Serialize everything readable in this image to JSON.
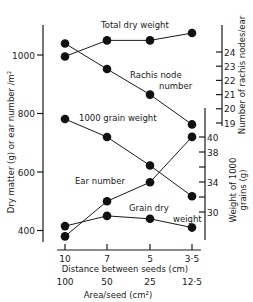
{
  "chart_data": {
    "type": "line",
    "title": "",
    "x": {
      "label": "Distance between seeds (cm)",
      "categories": [
        "10",
        "7",
        "5",
        "3·5"
      ],
      "secondary_label": "Area/seed (cm²)",
      "secondary_categories": [
        "100",
        "50",
        "25",
        "12·5"
      ]
    },
    "axes": {
      "left": {
        "label": "Dry matter (g) or ear number /m²",
        "ticks": [
          "400",
          "600",
          "800",
          "1000"
        ],
        "tick_values": [
          400,
          600,
          800,
          1000
        ],
        "range": [
          340,
          1130
        ]
      },
      "right_rachis": {
        "label": "Number of rachis nodes/ear",
        "ticks": [
          "19",
          "20",
          "21",
          "22",
          "23",
          "24"
        ],
        "tick_values": [
          19,
          20,
          21,
          22,
          23,
          24
        ],
        "range": [
          19,
          26
        ]
      },
      "right_grain": {
        "label_line1": "Weight of 1000",
        "label_line2": "grains (g)",
        "ticks": [
          "30",
          "34",
          "38",
          "40"
        ],
        "tick_values": [
          30,
          32,
          34,
          36,
          38,
          40
        ],
        "range": [
          26,
          40
        ]
      }
    },
    "series": [
      {
        "name": "Total dry weight",
        "axis": "left",
        "values": [
          995,
          1050,
          1050,
          1075
        ]
      },
      {
        "name": "Rachis node number",
        "axis": "right_rachis",
        "values": [
          24.6,
          22.8,
          21.0,
          18.9
        ]
      },
      {
        "name": "1000 grain weight",
        "axis": "right_grain",
        "values": [
          42.4,
          40.0,
          36.2,
          32.1
        ]
      },
      {
        "name": "Ear number",
        "axis": "left",
        "values": [
          380,
          500,
          565,
          720
        ]
      },
      {
        "name": "Grain dry weight",
        "axis": "left",
        "values": [
          415,
          450,
          440,
          410
        ]
      }
    ],
    "annotations": {
      "total_dry_weight": "Total dry weight",
      "rachis_line1": "Rachis node",
      "rachis_line2": "number",
      "grain_weight_1000": "1000 grain weight",
      "ear_number": "Ear number",
      "grain_dry_line1": "Grain dry",
      "grain_dry_line2": "weight"
    },
    "grid": false,
    "legend": "none (inline labels)"
  }
}
